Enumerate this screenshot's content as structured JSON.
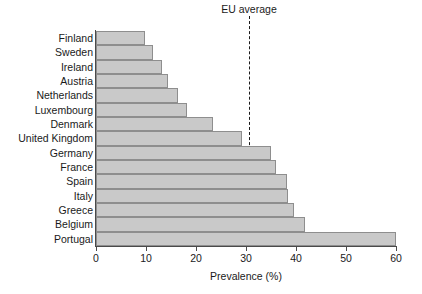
{
  "chart_data": {
    "type": "bar",
    "orientation": "horizontal",
    "title": "",
    "xlabel": "Prevalence (%)",
    "ylabel": "",
    "xlim": [
      0,
      60
    ],
    "xticks": [
      0,
      10,
      20,
      30,
      40,
      50,
      60
    ],
    "xticklabels": [
      "0",
      "10",
      "20",
      "30",
      "40",
      "50",
      "60"
    ],
    "grid": false,
    "legend": null,
    "categories": [
      "Finland",
      "Sweden",
      "Ireland",
      "Austria",
      "Netherlands",
      "Luxembourg",
      "Denmark",
      "United Kingdom",
      "Germany",
      "France",
      "Spain",
      "Italy",
      "Greece",
      "Belgium",
      "Portugal"
    ],
    "values": [
      9.8,
      11.4,
      13.2,
      14.4,
      16.4,
      18.2,
      23.4,
      29.2,
      35.0,
      36.0,
      38.2,
      38.4,
      39.6,
      41.8,
      60.0
    ],
    "annotations": [
      {
        "label": "EU average",
        "type": "vline",
        "value": 30.6,
        "style": "dashed"
      }
    ],
    "colors": {
      "bar_fill": "#c9c9c9",
      "bar_border": "#8e8e8e",
      "axis": "#4a4a4a",
      "text": "#1a1a1a",
      "background": "#ffffff"
    }
  }
}
